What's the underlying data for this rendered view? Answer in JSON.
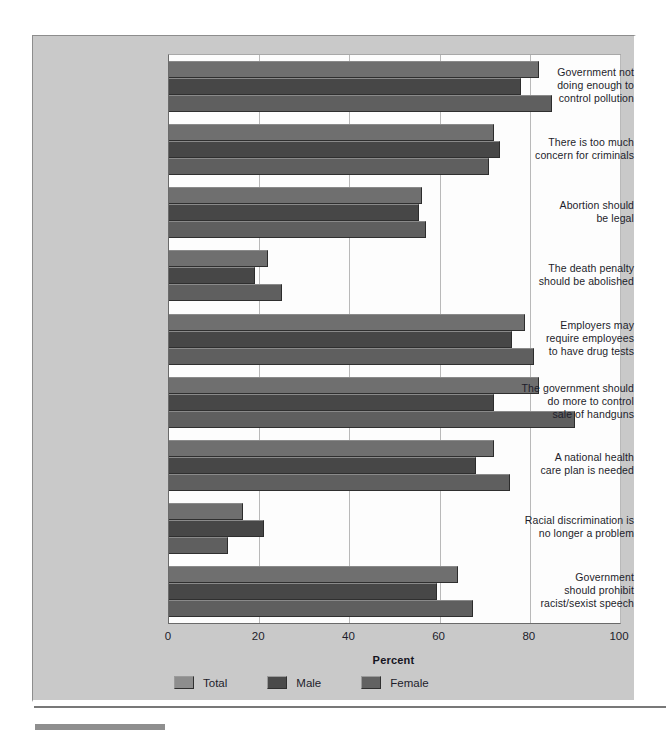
{
  "chart_data": {
    "type": "bar",
    "orientation": "horizontal",
    "title": "",
    "xlabel": "Percent",
    "ylabel": "",
    "xlim": [
      0,
      100
    ],
    "xticks": [
      0,
      20,
      40,
      60,
      80,
      100
    ],
    "grid": true,
    "legend_position": "bottom-left",
    "categories": [
      "Government not\ndoing enough to\ncontrol pollution",
      "There is too much\nconcern for criminals",
      "Abortion should\nbe legal",
      "The death penalty\nshould be abolished",
      "Employers may\nrequire employees\nto have drug tests",
      "The government should\ndo more to control\nsale of handguns",
      "A national health\ncare plan is needed",
      "Racial discrimination is\nno longer a problem",
      "Government\nshould prohibit\nracist/sexist speech"
    ],
    "series": [
      {
        "name": "Total",
        "color": "#6f6f6f",
        "values": [
          82,
          72,
          56,
          22,
          79,
          82,
          72,
          16.5,
          64
        ]
      },
      {
        "name": "Male",
        "color": "#474747",
        "values": [
          78,
          73.5,
          55.5,
          19,
          76,
          72,
          68,
          21,
          59.5
        ]
      },
      {
        "name": "Female",
        "color": "#5f5f5f",
        "values": [
          85,
          71,
          57,
          25,
          81,
          90,
          75.5,
          13,
          67.5
        ]
      }
    ]
  },
  "axis": {
    "tick_labels": [
      "0",
      "20",
      "40",
      "60",
      "80",
      "100"
    ],
    "x_title": "Percent"
  },
  "legend": {
    "items": [
      {
        "label": "Total",
        "swatch": "total"
      },
      {
        "label": "Male",
        "swatch": "male"
      },
      {
        "label": "Female",
        "swatch": "female"
      }
    ]
  },
  "categories_display": [
    [
      "Government not",
      "doing enough to",
      "control pollution"
    ],
    [
      "There is too much",
      "concern for criminals"
    ],
    [
      "Abortion should",
      "be legal"
    ],
    [
      "The death penalty",
      "should be abolished"
    ],
    [
      "Employers may",
      "require employees",
      "to have drug tests"
    ],
    [
      "The government should",
      "do more to control",
      "sale of handguns"
    ],
    [
      "A national health",
      "care plan is needed"
    ],
    [
      "Racial discrimination is",
      "no longer a problem"
    ],
    [
      "Government",
      "should prohibit",
      "racist/sexist speech"
    ]
  ]
}
